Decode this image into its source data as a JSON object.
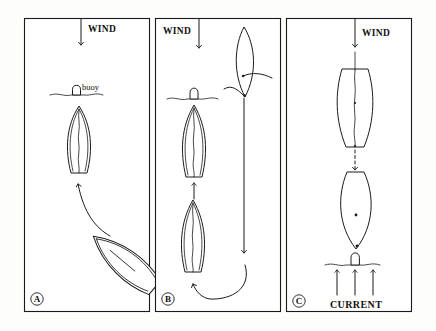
{
  "figure": {
    "background_color": "#fdfdfb",
    "ink_color": "#1a1a1a",
    "width": 436,
    "height": 331
  },
  "panels": [
    {
      "id": "A",
      "badge_label": "A",
      "wind_label": "WIND",
      "wind_label_side": "right",
      "buoy_label": "buoy",
      "has_buoy": true,
      "has_current": false,
      "boats": [
        {
          "name": "boat-head-to-wind",
          "orientation_deg": 0,
          "has_sail_line": true
        },
        {
          "name": "boat-approaching-tilted",
          "orientation_deg": -50,
          "has_sail_line": false
        }
      ],
      "arrows": [
        {
          "name": "wind-arrow",
          "style": "solid",
          "direction": "down"
        },
        {
          "name": "approach-arrow",
          "style": "curved",
          "direction": "up"
        }
      ]
    },
    {
      "id": "B",
      "badge_label": "B",
      "wind_label": "WIND",
      "wind_label_side": "left",
      "buoy_label": "",
      "has_buoy": true,
      "has_current": false,
      "boats": [
        {
          "name": "boat-at-buoy",
          "orientation_deg": 0,
          "has_sail_line": true
        },
        {
          "name": "boat-below",
          "orientation_deg": 0,
          "has_sail_line": true
        },
        {
          "name": "boat-running-downwind",
          "orientation_deg": 0,
          "has_sail_line": false
        }
      ],
      "arrows": [
        {
          "name": "wind-arrow",
          "style": "solid",
          "direction": "down"
        },
        {
          "name": "final-approach-arrow",
          "style": "solid",
          "direction": "up"
        },
        {
          "name": "downwind-run-arrow",
          "style": "solid",
          "direction": "down"
        },
        {
          "name": "turn-around-arrow",
          "style": "curved",
          "direction": "up"
        }
      ]
    },
    {
      "id": "C",
      "badge_label": "C",
      "wind_label": "WIND",
      "wind_label_side": "right",
      "buoy_label": "",
      "has_buoy": true,
      "has_current": true,
      "current_label": "CURRENT",
      "boats": [
        {
          "name": "boat-upwind",
          "orientation_deg": 0,
          "has_sail_line": true
        },
        {
          "name": "boat-stemming-current",
          "orientation_deg": 0,
          "has_sail_line": false
        }
      ],
      "arrows": [
        {
          "name": "wind-arrow",
          "style": "solid",
          "direction": "down"
        },
        {
          "name": "drift-arrow",
          "style": "dashed",
          "direction": "down"
        },
        {
          "name": "current-arrow-left",
          "style": "solid",
          "direction": "up"
        },
        {
          "name": "current-arrow-middle",
          "style": "solid",
          "direction": "up"
        },
        {
          "name": "current-arrow-right",
          "style": "solid",
          "direction": "up"
        }
      ]
    }
  ]
}
